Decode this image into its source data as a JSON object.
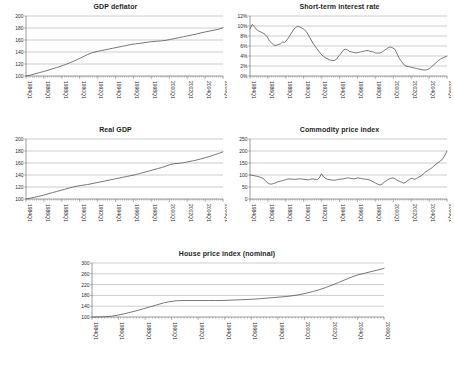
{
  "figure": {
    "background": "#ffffff",
    "line_color": "#4b4b4b",
    "grid_color": "#9a9a9a"
  },
  "chart_data": [
    {
      "type": "line",
      "title": "GDP deflator",
      "xlabel": "",
      "ylabel": "",
      "ylim": [
        100,
        200
      ],
      "yticks": [
        "100",
        "120",
        "140",
        "160",
        "180",
        "200"
      ],
      "grid": true,
      "legend": "none",
      "xticks": [
        "1984Q1",
        "1986Q1",
        "1988Q1",
        "1990Q1",
        "1992Q1",
        "1994Q1",
        "1996Q1",
        "1998Q1",
        "2000Q1",
        "2002Q1",
        "2004Q1",
        "2006Q1"
      ],
      "x": [
        1984,
        1984.5,
        1985,
        1985.5,
        1986,
        1986.5,
        1987,
        1987.5,
        1988,
        1988.5,
        1989,
        1989.5,
        1990,
        1990.5,
        1991,
        1991.5,
        1992,
        1992.5,
        1993,
        1993.5,
        1994,
        1994.5,
        1995,
        1995.5,
        1996,
        1996.5,
        1997,
        1997.5,
        1998,
        1998.5,
        1999,
        1999.5,
        2000,
        2000.5,
        2001,
        2001.5,
        2002,
        2002.5,
        2003,
        2003.5,
        2004,
        2004.5,
        2005,
        2005.5,
        2006,
        2006.5
      ],
      "values": [
        100,
        101.5,
        103.5,
        105.5,
        107.5,
        109.5,
        112,
        114,
        116.5,
        119,
        122,
        125,
        128.5,
        132,
        135.5,
        138.5,
        140.5,
        142,
        143.5,
        145,
        146.5,
        148,
        149.5,
        151,
        152.5,
        153.5,
        154.5,
        155.5,
        156.5,
        157.5,
        158,
        158.5,
        159.5,
        161,
        162.5,
        164,
        165.5,
        167,
        168.5,
        170,
        172,
        173.5,
        175,
        176.5,
        178,
        180.5
      ]
    },
    {
      "type": "line",
      "title": "Short-term interest rate",
      "xlabel": "",
      "ylabel": "",
      "ylim": [
        0,
        12
      ],
      "yticks": [
        "0%",
        "2%",
        "4%",
        "6%",
        "8%",
        "10%",
        "12%"
      ],
      "grid": true,
      "legend": "none",
      "xticks": [
        "1984Q1",
        "1986Q1",
        "1988Q1",
        "1990Q1",
        "1992Q1",
        "1994Q1",
        "1996Q1",
        "1998Q1",
        "2000Q1",
        "2002Q1",
        "2004Q1",
        "2006Q1"
      ],
      "x": [
        1984,
        1984.25,
        1984.5,
        1984.75,
        1985,
        1985.25,
        1985.5,
        1985.75,
        1986,
        1986.25,
        1986.5,
        1986.75,
        1987,
        1987.25,
        1987.5,
        1987.75,
        1988,
        1988.25,
        1988.5,
        1988.75,
        1989,
        1989.25,
        1989.5,
        1989.75,
        1990,
        1990.25,
        1990.5,
        1990.75,
        1991,
        1991.25,
        1991.5,
        1991.75,
        1992,
        1992.25,
        1992.5,
        1992.75,
        1993,
        1993.25,
        1993.5,
        1993.75,
        1994,
        1994.25,
        1994.5,
        1994.75,
        1995,
        1995.25,
        1995.5,
        1995.75,
        1996,
        1996.25,
        1996.5,
        1996.75,
        1997,
        1997.25,
        1997.5,
        1997.75,
        1998,
        1998.25,
        1998.5,
        1998.75,
        1999,
        1999.25,
        1999.5,
        1999.75,
        2000,
        2000.25,
        2000.5,
        2000.75,
        2001,
        2001.25,
        2001.5,
        2001.75,
        2002,
        2002.25,
        2002.5,
        2002.75,
        2003,
        2003.25,
        2003.5,
        2003.75,
        2004,
        2004.25,
        2004.5,
        2004.75,
        2005,
        2005.25,
        2005.5,
        2005.75,
        2006,
        2006.25,
        2006.5,
        2006.75
      ],
      "values": [
        9.4,
        10.3,
        9.9,
        9.3,
        9.0,
        8.8,
        8.6,
        8.3,
        7.8,
        7.0,
        6.6,
        6.2,
        6.1,
        6.3,
        6.4,
        6.8,
        6.7,
        7.2,
        7.8,
        8.5,
        9.2,
        9.7,
        9.9,
        9.8,
        9.6,
        9.3,
        8.9,
        8.2,
        7.4,
        6.6,
        6.0,
        5.4,
        4.8,
        4.3,
        3.9,
        3.6,
        3.4,
        3.2,
        3.1,
        3.1,
        3.4,
        4.0,
        4.5,
        5.1,
        5.4,
        5.2,
        4.9,
        4.8,
        4.7,
        4.6,
        4.7,
        4.8,
        4.9,
        5.0,
        5.1,
        5.0,
        4.9,
        4.8,
        4.6,
        4.6,
        4.6,
        4.8,
        5.1,
        5.4,
        5.7,
        5.8,
        5.6,
        5.3,
        4.4,
        3.5,
        2.9,
        2.3,
        2.0,
        1.9,
        1.8,
        1.7,
        1.6,
        1.5,
        1.4,
        1.3,
        1.2,
        1.2,
        1.3,
        1.5,
        1.9,
        2.3,
        2.7,
        3.1,
        3.4,
        3.6,
        3.8,
        4.0,
        4.1,
        4.3
      ]
    },
    {
      "type": "line",
      "title": "Real GDP",
      "xlabel": "",
      "ylabel": "",
      "ylim": [
        100,
        200
      ],
      "yticks": [
        "100",
        "120",
        "140",
        "160",
        "180",
        "200"
      ],
      "grid": true,
      "legend": "none",
      "xticks": [
        "1984Q1",
        "1986Q1",
        "1988Q1",
        "1990Q1",
        "1992Q1",
        "1994Q1",
        "1996Q1",
        "1998Q1",
        "2000Q1",
        "2002Q1",
        "2004Q1",
        "2006Q1"
      ],
      "x": [
        1984,
        1984.5,
        1985,
        1985.5,
        1986,
        1986.5,
        1987,
        1987.5,
        1988,
        1988.5,
        1989,
        1989.5,
        1990,
        1990.5,
        1991,
        1991.5,
        1992,
        1992.5,
        1993,
        1993.5,
        1994,
        1994.5,
        1995,
        1995.5,
        1996,
        1996.5,
        1997,
        1997.5,
        1998,
        1998.5,
        1999,
        1999.5,
        2000,
        2000.5,
        2001,
        2001.5,
        2002,
        2002.5,
        2003,
        2003.5,
        2004,
        2004.5,
        2005,
        2005.5,
        2006,
        2006.5
      ],
      "values": [
        100,
        101.5,
        103,
        104.5,
        106.5,
        108.5,
        110.5,
        112.5,
        114.5,
        116.5,
        118.5,
        120.5,
        122,
        123,
        124,
        125.5,
        127,
        128.5,
        130,
        131.5,
        133,
        134.5,
        136,
        137.5,
        139,
        140.5,
        142.5,
        144.5,
        146.5,
        148.5,
        150.5,
        152.5,
        155,
        157.5,
        159,
        159.5,
        160.5,
        162,
        163.5,
        165,
        167,
        169,
        171,
        173.5,
        176,
        178.5
      ]
    },
    {
      "type": "line",
      "title": "Commodity price index",
      "xlabel": "",
      "ylabel": "",
      "ylim": [
        0,
        250
      ],
      "yticks": [
        "0",
        "50",
        "100",
        "150",
        "200",
        "250"
      ],
      "grid": true,
      "legend": "none",
      "xticks": [
        "1984Q1",
        "1986Q1",
        "1988Q1",
        "1990Q1",
        "1992Q1",
        "1994Q1",
        "1996Q1",
        "1998Q1",
        "2000Q1",
        "2002Q1",
        "2004Q1",
        "2006Q1"
      ],
      "x": [
        1984,
        1984.25,
        1984.5,
        1984.75,
        1985,
        1985.25,
        1985.5,
        1985.75,
        1986,
        1986.25,
        1986.5,
        1986.75,
        1987,
        1987.25,
        1987.5,
        1987.75,
        1988,
        1988.25,
        1988.5,
        1988.75,
        1989,
        1989.25,
        1989.5,
        1989.75,
        1990,
        1990.25,
        1990.5,
        1990.75,
        1991,
        1991.25,
        1991.5,
        1991.75,
        1992,
        1992.25,
        1992.5,
        1992.75,
        1993,
        1993.25,
        1993.5,
        1993.75,
        1994,
        1994.25,
        1994.5,
        1994.75,
        1995,
        1995.25,
        1995.5,
        1995.75,
        1996,
        1996.25,
        1996.5,
        1996.75,
        1997,
        1997.25,
        1997.5,
        1997.75,
        1998,
        1998.25,
        1998.5,
        1998.75,
        1999,
        1999.25,
        1999.5,
        1999.75,
        2000,
        2000.25,
        2000.5,
        2000.75,
        2001,
        2001.25,
        2001.5,
        2001.75,
        2002,
        2002.25,
        2002.5,
        2002.75,
        2003,
        2003.25,
        2003.5,
        2003.75,
        2004,
        2004.25,
        2004.5,
        2004.75,
        2005,
        2005.25,
        2005.5,
        2005.75,
        2006,
        2006.25,
        2006.5,
        2006.75
      ],
      "values": [
        100,
        99,
        97,
        95,
        93,
        90,
        86,
        78,
        68,
        63,
        62,
        65,
        68,
        72,
        74,
        76,
        79,
        82,
        84,
        83,
        82,
        82,
        83,
        84,
        83,
        82,
        81,
        80,
        82,
        84,
        82,
        80,
        88,
        105,
        92,
        85,
        82,
        80,
        79,
        78,
        80,
        82,
        83,
        84,
        86,
        88,
        87,
        85,
        84,
        86,
        88,
        86,
        84,
        83,
        82,
        80,
        76,
        71,
        66,
        62,
        58,
        62,
        70,
        76,
        82,
        86,
        88,
        84,
        78,
        74,
        70,
        66,
        70,
        78,
        84,
        86,
        82,
        86,
        92,
        96,
        104,
        112,
        118,
        124,
        130,
        138,
        146,
        152,
        158,
        168,
        182,
        200
      ]
    },
    {
      "type": "line",
      "title": "House price index (nominal)",
      "xlabel": "",
      "ylabel": "",
      "ylim": [
        100,
        300
      ],
      "yticks": [
        "100",
        "140",
        "180",
        "220",
        "260",
        "300"
      ],
      "grid": true,
      "legend": "none",
      "xticks": [
        "1984Q1",
        "1986Q1",
        "1988Q1",
        "1990Q1",
        "1992Q1",
        "1994Q1",
        "1996Q1",
        "1998Q1",
        "2000Q1",
        "2002Q1",
        "2004Q1",
        "2006Q1"
      ],
      "x": [
        1984,
        1984.5,
        1985,
        1985.5,
        1986,
        1986.5,
        1987,
        1987.5,
        1988,
        1988.5,
        1989,
        1989.5,
        1990,
        1990.5,
        1991,
        1991.5,
        1992,
        1992.5,
        1993,
        1993.5,
        1994,
        1994.5,
        1995,
        1995.5,
        1996,
        1996.5,
        1997,
        1997.5,
        1998,
        1998.5,
        1999,
        1999.5,
        2000,
        2000.5,
        2001,
        2001.5,
        2002,
        2002.5,
        2003,
        2003.5,
        2004,
        2004.5,
        2005,
        2005.5,
        2006,
        2006.5
      ],
      "values": [
        100,
        100,
        101,
        103,
        107,
        112,
        118,
        124,
        131,
        138,
        145,
        152,
        157,
        160,
        161,
        161,
        161,
        161,
        161,
        161,
        161,
        162,
        163,
        164,
        165,
        166,
        168,
        170,
        172,
        174,
        176,
        179,
        183,
        188,
        194,
        201,
        209,
        218,
        228,
        238,
        248,
        256,
        262,
        268,
        274,
        280
      ]
    }
  ]
}
